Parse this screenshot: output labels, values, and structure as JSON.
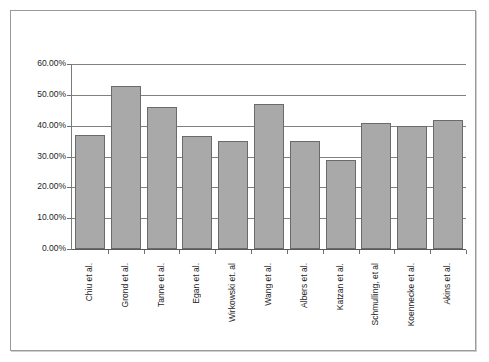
{
  "chart_data": {
    "type": "bar",
    "title": "",
    "subtitle": "",
    "xlabel": "",
    "ylabel": "",
    "ylim": [
      0,
      60
    ],
    "grid": true,
    "legend": "none",
    "y_tick_labels": [
      "60.00%",
      "50.00%",
      "40.00%",
      "30.00%",
      "20.00%",
      "10.00%",
      "0.00%"
    ],
    "y_tick_values": [
      60,
      50,
      40,
      30,
      20,
      10,
      0
    ],
    "value_suffix": "%",
    "categories": [
      "Chiu et al.",
      "Grond et al.",
      "Tanne et al.",
      "Egan et al.",
      "Wirkowski et. al",
      "Wang et al.",
      "Albers et al.",
      "Katzan et al.",
      "Schmulling, et al",
      "Koennecke et al.",
      "Akins et al."
    ],
    "values": [
      37,
      53,
      46,
      36.5,
      35,
      47,
      35,
      29,
      41,
      40,
      42
    ],
    "series": [
      {
        "name": "",
        "values": [
          37,
          53,
          46,
          36.5,
          35,
          47,
          35,
          29,
          41,
          40,
          42
        ]
      }
    ],
    "colors": {
      "bar_fill": "#a9a9a9",
      "bar_border": "#6b6b6b",
      "gridline": "#808080",
      "axis": "#7a7a7a",
      "frame_border": "#9a9a9a",
      "background": "#ffffff",
      "text": "#1d1d1d"
    }
  }
}
